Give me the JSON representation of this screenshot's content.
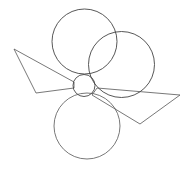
{
  "diagram": {
    "width": 186,
    "height": 170,
    "background": "#ffffff",
    "stroke_color": "#555555",
    "circles": [
      {
        "name": "top-circle",
        "cx": 84.5,
        "cy": 41.5,
        "r": 32.5
      },
      {
        "name": "right-circle",
        "cx": 121.5,
        "cy": 64.5,
        "r": 33
      },
      {
        "name": "center-small-circle",
        "cx": 84,
        "cy": 85.5,
        "r": 11
      },
      {
        "name": "bottom-circle",
        "cx": 87,
        "cy": 126,
        "r": 33
      }
    ],
    "polygons": [
      {
        "name": "left-quadrilateral",
        "points": "14,49 74,82 74,88 36,93"
      },
      {
        "name": "right-quadrilateral",
        "points": "97,88 180,95 140,124 92,95"
      }
    ]
  }
}
